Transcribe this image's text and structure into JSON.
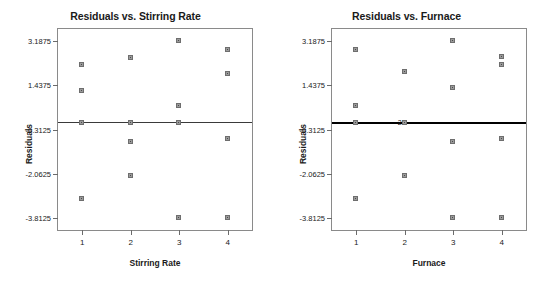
{
  "chart_data": [
    {
      "type": "scatter",
      "title": "Residuals vs. Stirring Rate",
      "xlabel": "Stirring Rate",
      "ylabel": "Residuals",
      "x_ticks": [
        "1",
        "2",
        "3",
        "4"
      ],
      "x_tick_values": [
        1,
        2,
        3,
        4
      ],
      "y_ticks": [
        "3.1875",
        "1.4375",
        "-0.3125",
        "-2.0625",
        "-3.8125"
      ],
      "y_tick_values": [
        3.1875,
        1.4375,
        -0.3125,
        -2.0625,
        -3.8125
      ],
      "xlim": [
        0.5,
        4.5
      ],
      "ylim": [
        -4.27,
        3.65
      ],
      "grid": false,
      "legend": "none",
      "reference_line": 0,
      "points": [
        {
          "x": 1,
          "y": 2.25
        },
        {
          "x": 1,
          "y": 1.19
        },
        {
          "x": 1,
          "y": -0.06
        },
        {
          "x": 1,
          "y": -3.06
        },
        {
          "x": 2,
          "y": 2.5
        },
        {
          "x": 2,
          "y": -0.06
        },
        {
          "x": 2,
          "y": -0.81
        },
        {
          "x": 2,
          "y": -2.13
        },
        {
          "x": 3,
          "y": 3.19
        },
        {
          "x": 3,
          "y": 0.63
        },
        {
          "x": 3,
          "y": -0.06
        },
        {
          "x": 3,
          "y": -3.81
        },
        {
          "x": 4,
          "y": 2.81
        },
        {
          "x": 4,
          "y": 1.88
        },
        {
          "x": 4,
          "y": -0.69
        },
        {
          "x": 4,
          "y": -3.81
        }
      ]
    },
    {
      "type": "scatter",
      "title": "Residuals vs. Furnace",
      "xlabel": "Furnace",
      "ylabel": "Residuals",
      "x_ticks": [
        "1",
        "2",
        "3",
        "4"
      ],
      "x_tick_values": [
        1,
        2,
        3,
        4
      ],
      "y_ticks": [
        "3.1875",
        "1.4375",
        "-0.3125",
        "-2.0625",
        "-3.8125"
      ],
      "y_tick_values": [
        3.1875,
        1.4375,
        -0.3125,
        -2.0625,
        -3.8125
      ],
      "xlim": [
        0.5,
        4.5
      ],
      "ylim": [
        -4.27,
        3.65
      ],
      "grid": false,
      "legend": "none",
      "reference_line": 0,
      "annotations": [
        {
          "text": "2",
          "x": 2,
          "y": 0.0
        }
      ],
      "points": [
        {
          "x": 1,
          "y": 2.81
        },
        {
          "x": 1,
          "y": 0.63
        },
        {
          "x": 1,
          "y": -0.06
        },
        {
          "x": 1,
          "y": -3.06
        },
        {
          "x": 2,
          "y": 1.94
        },
        {
          "x": 2,
          "y": -0.06
        },
        {
          "x": 2,
          "y": -2.13
        },
        {
          "x": 3,
          "y": 3.19
        },
        {
          "x": 3,
          "y": 1.31
        },
        {
          "x": 3,
          "y": -0.81
        },
        {
          "x": 3,
          "y": -3.81
        },
        {
          "x": 4,
          "y": 2.56
        },
        {
          "x": 4,
          "y": 2.25
        },
        {
          "x": 4,
          "y": -0.69
        },
        {
          "x": 4,
          "y": -3.81
        }
      ]
    }
  ]
}
